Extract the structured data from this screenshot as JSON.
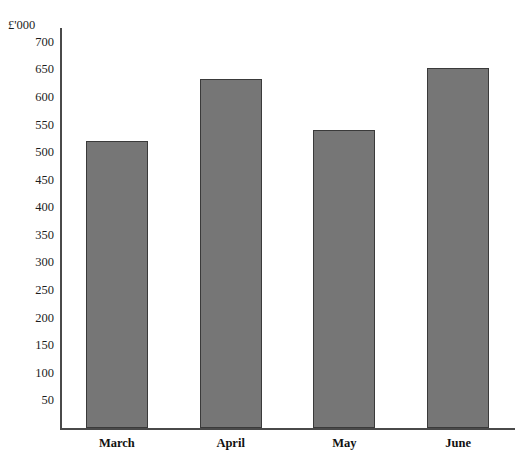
{
  "chart_data": {
    "type": "bar",
    "title": "",
    "xlabel": "",
    "ylabel": "£'000",
    "categories": [
      "March",
      "April",
      "May",
      "June"
    ],
    "values": [
      520,
      632,
      540,
      653
    ],
    "ylim": [
      0,
      725
    ],
    "y_ticks": [
      700,
      650,
      600,
      550,
      500,
      450,
      400,
      350,
      300,
      250,
      200,
      150,
      100,
      50
    ],
    "grid": false,
    "legend": null,
    "bar_color": "#767676",
    "bar_border_color": "#3a3a3a",
    "axis_color": "#4a4a4a"
  },
  "axis": {
    "unit_caption": "£'000"
  }
}
